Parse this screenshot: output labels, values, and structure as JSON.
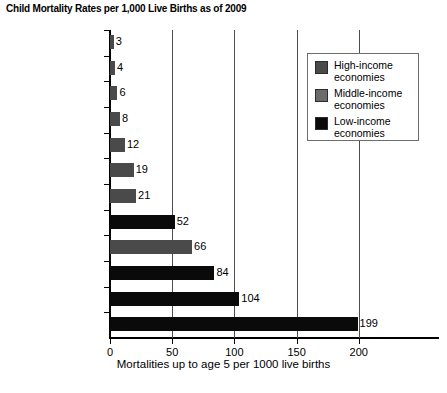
{
  "chart_data": {
    "type": "bar",
    "orientation": "horizontal",
    "title": "Child Mortality Rates per 1,000 Live Births as of 2009",
    "xlabel": "Mortalities up to age 5 per 1000 live births",
    "ylabel": "",
    "xlim": [
      0,
      205
    ],
    "xticks": [
      0,
      50,
      100,
      150,
      200
    ],
    "xtick_labels": [
      "0",
      "50",
      "100",
      "150",
      "200"
    ],
    "grid": "vertical",
    "legend_position": "top-right",
    "categories": [
      "Japan",
      "Germany",
      "United Kingdom",
      "United States",
      "Russia",
      "China",
      "Brazil",
      "Bangladesh",
      "India",
      "Kenya",
      "Ethiopia",
      "Congo"
    ],
    "values": [
      3,
      4,
      6,
      8,
      12,
      19,
      21,
      52,
      66,
      84,
      104,
      199
    ],
    "value_labels": [
      "3",
      "4",
      "6",
      "8",
      "12",
      "19",
      "21",
      "52",
      "66",
      "84",
      "104",
      "199"
    ],
    "groups": [
      "high",
      "high",
      "high",
      "high",
      "middle",
      "middle",
      "middle",
      "low",
      "middle",
      "low",
      "low",
      "low"
    ],
    "group_colors": {
      "high": "#4a4a4a",
      "middle": "#4a4a4a",
      "low": "#0a0a0a"
    },
    "legend": [
      {
        "label_line1": "High-income",
        "label_line2": "economies",
        "color": "#4a4a4a",
        "key": "high"
      },
      {
        "label_line1": "Middle-income",
        "label_line2": "economies",
        "color": "#6b6b6b",
        "key": "middle"
      },
      {
        "label_line1": "Low-income",
        "label_line2": "economies",
        "color": "#0a0a0a",
        "key": "low"
      }
    ]
  }
}
